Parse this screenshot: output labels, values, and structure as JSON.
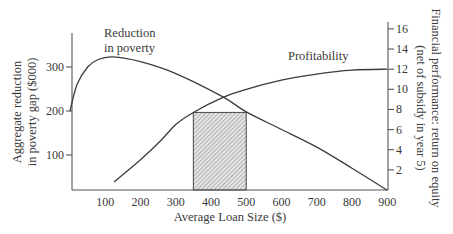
{
  "chart_data": {
    "type": "line",
    "title": "",
    "xlabel": "Average Loan Size ($)",
    "ylabel": "Aggregate reduction in poverty gap ($000)",
    "ylabel_lines": [
      "Aggregate reduction",
      "in poverty gap ($000)"
    ],
    "y2label": "Financial performance: return on equity (net of subsidy in year 5)",
    "y2label_lines": [
      "Financial performance: return on equity",
      "(net of subsidy in year 5)"
    ],
    "xlim": [
      0,
      900
    ],
    "ylim": [
      20,
      375
    ],
    "y2lim": [
      0,
      16
    ],
    "x_ticks": [
      100,
      200,
      300,
      400,
      500,
      600,
      700,
      800,
      900
    ],
    "y_ticks": [
      100,
      200,
      300
    ],
    "y2_ticks": [
      2,
      4,
      6,
      8,
      10,
      12,
      14,
      16
    ],
    "grid": false,
    "legend": "none (inline curve labels)",
    "series": [
      {
        "name": "Reduction in poverty",
        "axis": "left",
        "label_lines": [
          "Reduction",
          "in poverty"
        ],
        "x": [
          0,
          20,
          50,
          80,
          122,
          200,
          300,
          434,
          500,
          600,
          700,
          800,
          900
        ],
        "values": [
          200,
          260,
          300,
          317,
          323,
          312,
          285,
          232,
          198,
          158,
          118,
          70,
          20
        ]
      },
      {
        "name": "Profitability",
        "axis": "right",
        "label_lines": [
          "Profitability"
        ],
        "x": [
          125,
          200,
          260,
          300,
          350,
          434,
          500,
          600,
          700,
          800,
          900
        ],
        "values": [
          0.8,
          3.0,
          5.0,
          6.5,
          7.7,
          9.2,
          10.0,
          10.9,
          11.5,
          11.9,
          12.0
        ]
      }
    ],
    "annotations": [
      {
        "type": "hatched_region",
        "x_range": [
          350,
          500
        ],
        "y2_top": 7.7,
        "description": "Hatched rectangle marking optimal average loan size range"
      }
    ]
  }
}
